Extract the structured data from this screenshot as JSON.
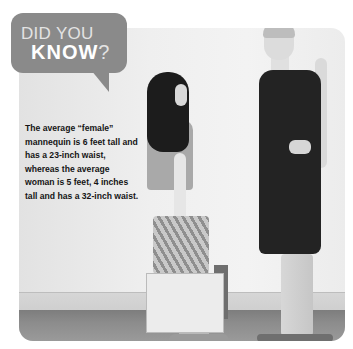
{
  "callout": {
    "line1": "DID YOU",
    "line2": "KNOW",
    "punctuation": "?"
  },
  "fact": {
    "text": "The average “female” mannequin is 6 feet tall and has a 23-inch waist, whereas the average woman is 5 feet, 4 inches tall and has a 32-inch waist."
  },
  "photo": {
    "description": "Grayscale photo of a short girl with long dark hair holding a shopping bag facing a tall slim woman in a dark sleeveless dress"
  },
  "colors": {
    "bubble": "#8a8a8a",
    "bubble_text_light": "#e3e3e3",
    "bubble_text_bold": "#ffffff",
    "fact_text": "#151515"
  }
}
